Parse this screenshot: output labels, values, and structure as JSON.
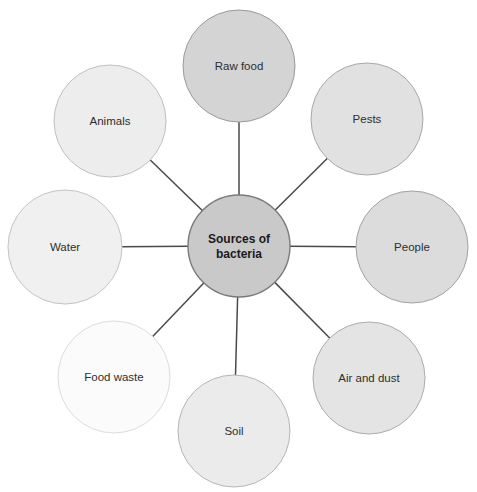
{
  "diagram": {
    "type": "hub-and-spoke",
    "title_fragment": "",
    "background_color": "#ffffff",
    "line_color": "#4a4a4a",
    "hub": {
      "label_line1": "Sources of",
      "label_line2": "bacteria",
      "label": "Sources of bacteria",
      "cx": 239,
      "cy": 246,
      "r": 51,
      "fill": "#c9c9c9",
      "stroke": "#7a7a7a"
    },
    "nodes": [
      {
        "name": "raw-food",
        "label": "Raw food",
        "cx": 239,
        "cy": 66,
        "r": 56,
        "fill": "#d4d4d4",
        "stroke": "#9a9a9a",
        "angle_deg": 270
      },
      {
        "name": "pests",
        "label": "Pests",
        "cx": 367,
        "cy": 119,
        "r": 56,
        "fill": "#e1e1e1",
        "stroke": "#a8a8a8",
        "angle_deg": 315
      },
      {
        "name": "people",
        "label": "People",
        "cx": 412,
        "cy": 247,
        "r": 56,
        "fill": "#dcdcdc",
        "stroke": "#a2a2a2",
        "angle_deg": 0
      },
      {
        "name": "air-and-dust",
        "label": "Air and dust",
        "cx": 369,
        "cy": 378,
        "r": 56,
        "fill": "#e4e4e4",
        "stroke": "#acacac",
        "angle_deg": 45
      },
      {
        "name": "soil",
        "label": "Soil",
        "cx": 234,
        "cy": 431,
        "r": 56,
        "fill": "#ebebeb",
        "stroke": "#b6b6b6",
        "angle_deg": 90
      },
      {
        "name": "food-waste",
        "label": "Food waste",
        "cx": 114,
        "cy": 377,
        "r": 56,
        "fill": "#fbfbfb",
        "stroke": "#dcdcdc",
        "angle_deg": 135
      },
      {
        "name": "water",
        "label": "Water",
        "cx": 65,
        "cy": 247,
        "r": 57,
        "fill": "#f0f0f0",
        "stroke": "#c4c4c4",
        "angle_deg": 180
      },
      {
        "name": "animals",
        "label": "Animals",
        "cx": 110,
        "cy": 121,
        "r": 56,
        "fill": "#ededed",
        "stroke": "#c0c0c0",
        "angle_deg": 225
      }
    ]
  }
}
